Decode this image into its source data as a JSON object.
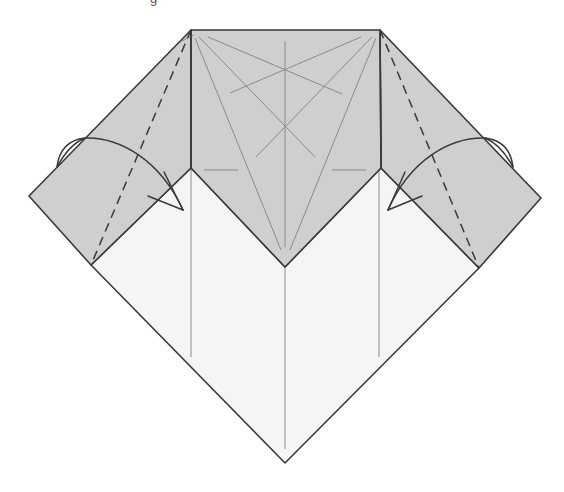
{
  "diagram": {
    "caption_partial": "g",
    "colors": {
      "paper_colored": "#cfcfcf",
      "paper_white": "#f5f5f5",
      "edge": "#3a3a3a",
      "crease": "#8a8a8a",
      "background": "#ffffff"
    },
    "shapes": {
      "center_panel": "191,30 380,30 381,168 285,267 191,168",
      "left_flap": "191,30 29,196 91,265 191,168",
      "right_flap": "380,30 541,198 479,268 381,168",
      "white_base": "91,265 191,168 285,267 381,168 479,268 285,463"
    },
    "folds": [
      {
        "name": "left-valley-fold",
        "type": "valley",
        "from": [
          191,
          30
        ],
        "to": [
          91,
          265
        ]
      },
      {
        "name": "right-valley-fold",
        "type": "valley",
        "from": [
          380,
          30
        ],
        "to": [
          479,
          268
        ]
      }
    ],
    "arrows": [
      {
        "name": "left-fold-arrow",
        "direction": "fold-in-right"
      },
      {
        "name": "right-fold-arrow",
        "direction": "fold-in-left"
      }
    ]
  }
}
